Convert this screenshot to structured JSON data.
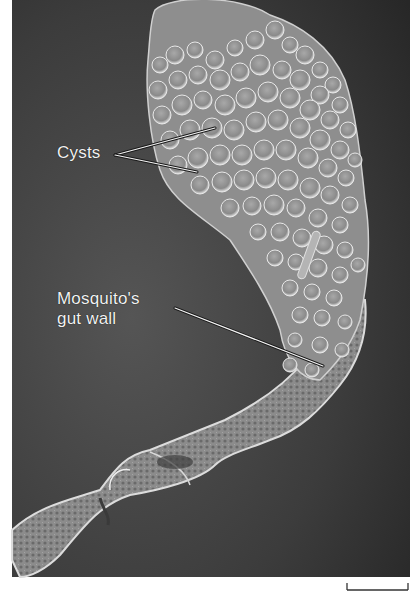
{
  "figure": {
    "type": "scanning electron micrograph",
    "background_color": "#3a3a3a",
    "specimen_color": "#b8b8b8"
  },
  "labels": {
    "cysts": "Cysts",
    "gut_wall_line1": "Mosquito's",
    "gut_wall_line2": "gut wall"
  },
  "scale_bar": {
    "label": ""
  }
}
